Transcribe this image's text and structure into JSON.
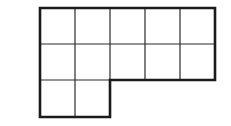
{
  "diagram": {
    "type": "grid-polyomino",
    "cell_count": 12,
    "rows": [
      {
        "row": 1,
        "cells": 5
      },
      {
        "row": 2,
        "cells": 5
      },
      {
        "row": 3,
        "cells": 2
      }
    ],
    "colors": {
      "background": "#ffffff",
      "lines": "#1a1a1a"
    }
  }
}
